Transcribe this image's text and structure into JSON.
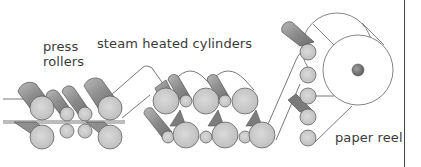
{
  "diagram": {
    "labels": {
      "press_rollers_line1": "press",
      "press_rollers_line2": "rollers",
      "steam_heated_cylinders": "steam heated cylinders",
      "paper_reel": "paper reel"
    },
    "nodes": [
      {
        "id": "press-rollers",
        "label": "press rollers"
      },
      {
        "id": "steam-heated-cylinders",
        "label": "steam heated cylinders"
      },
      {
        "id": "paper-reel",
        "label": "paper reel"
      }
    ],
    "flow": [
      "press-rollers",
      "steam-heated-cylinders",
      "paper-reel"
    ],
    "colors": {
      "cylinder_body": "#8c8c8c",
      "cylinder_end": "#cfcfcf",
      "outline": "#555555",
      "paper": "#ffffff",
      "text": "#3a3a3a",
      "reel_hub": "#7a7a7a"
    }
  }
}
